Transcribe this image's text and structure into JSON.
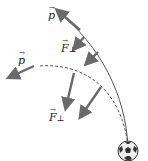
{
  "labels": {
    "p_top": "p",
    "p_left": "p",
    "f_upper": "F",
    "f_lower": "F",
    "perp": "⊥",
    "vec_arrow": "→"
  },
  "colors": {
    "vector": "#6a6a6a",
    "path": "#555555",
    "ball": "#333333"
  }
}
